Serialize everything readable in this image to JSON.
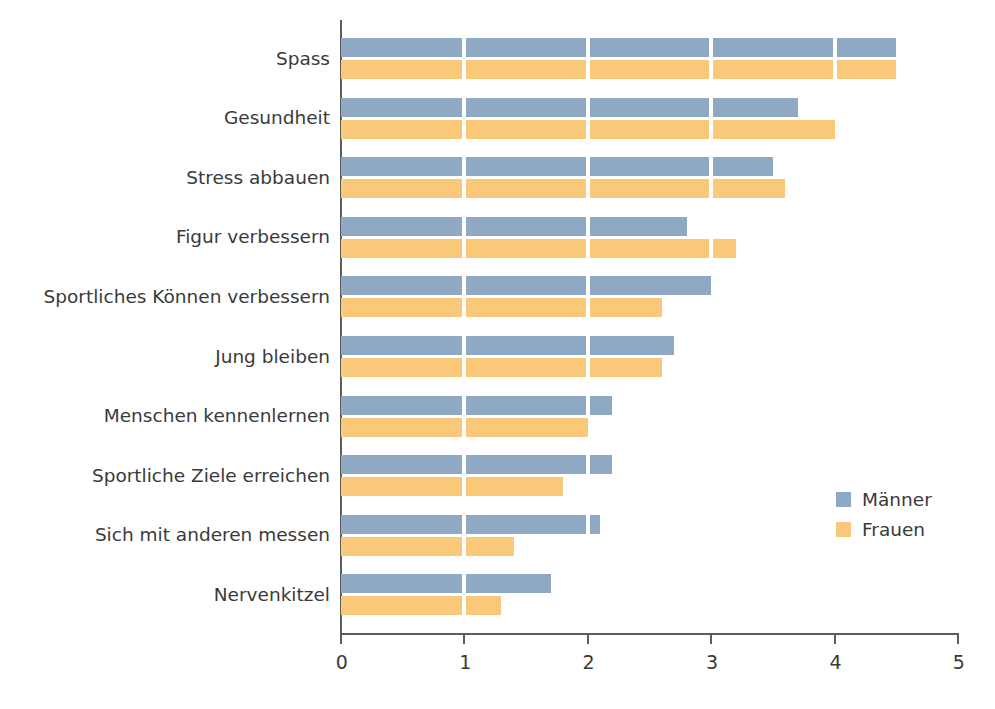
{
  "chart_data": {
    "type": "bar",
    "orientation": "horizontal",
    "title": "",
    "subtitle": "",
    "xlabel": "",
    "ylabel": "",
    "xlim": [
      0,
      5
    ],
    "xticks": [
      "0",
      "1",
      "2",
      "3",
      "4",
      "5"
    ],
    "grid": false,
    "legend_position": "right-middle",
    "categories": [
      "Spass",
      "Gesundheit",
      "Stress abbauen",
      "Figur verbessern",
      "Sportliches Können verbessern",
      "Jung bleiben",
      "Menschen kennenlernen",
      "Sportliche Ziele erreichen",
      "Sich mit anderen messen",
      "Nervenkitzel"
    ],
    "series": [
      {
        "name": "Männer",
        "color": "#8FA8C4",
        "values": [
          4.5,
          3.7,
          3.5,
          2.8,
          3.0,
          2.7,
          2.2,
          2.2,
          2.1,
          1.7
        ]
      },
      {
        "name": "Frauen",
        "color": "#F9C878",
        "values": [
          4.5,
          4.0,
          3.6,
          3.2,
          2.6,
          2.6,
          2.0,
          1.8,
          1.4,
          1.3
        ]
      }
    ]
  },
  "legend": {
    "items": [
      {
        "label": "Männer"
      },
      {
        "label": "Frauen"
      }
    ]
  },
  "axis": {
    "x_ticks": [
      "0",
      "1",
      "2",
      "3",
      "4",
      "5"
    ]
  }
}
